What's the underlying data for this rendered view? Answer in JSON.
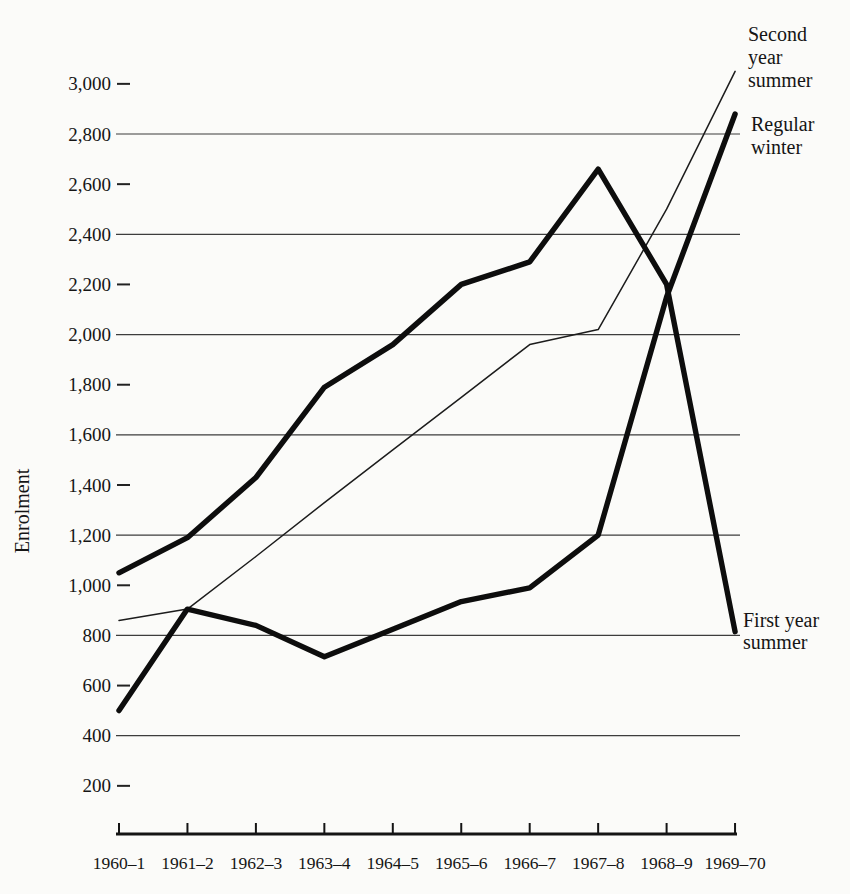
{
  "page": {
    "background_color": "#fbfbf9",
    "ink_color": "#151515"
  },
  "chart_data": {
    "type": "line",
    "title": "",
    "xlabel": "",
    "ylabel": "Enrolment",
    "ylim": [
      0,
      3100
    ],
    "grid": "horizontal solid lines at multiples of 400; short dash ticks at other 200-multiples",
    "legend_position": "right-edge annotations next to line ends",
    "categories": [
      "1960–1",
      "1961–2",
      "1962–3",
      "1963–4",
      "1964–5",
      "1965–6",
      "1966–7",
      "1967–8",
      "1968–9",
      "1969–70"
    ],
    "y_ticks": [
      {
        "value": 3000,
        "label": "3,000",
        "gridline": false
      },
      {
        "value": 2800,
        "label": "2,800",
        "gridline": true
      },
      {
        "value": 2600,
        "label": "2,600",
        "gridline": false
      },
      {
        "value": 2400,
        "label": "2,400",
        "gridline": true
      },
      {
        "value": 2200,
        "label": "2,200",
        "gridline": false
      },
      {
        "value": 2000,
        "label": "2,000",
        "gridline": true
      },
      {
        "value": 1800,
        "label": "1,800",
        "gridline": false
      },
      {
        "value": 1600,
        "label": "1,600",
        "gridline": true
      },
      {
        "value": 1400,
        "label": "1,400",
        "gridline": false
      },
      {
        "value": 1200,
        "label": "1,200",
        "gridline": true
      },
      {
        "value": 1000,
        "label": "1,000",
        "gridline": false
      },
      {
        "value": 800,
        "label": "800",
        "gridline": true
      },
      {
        "value": 600,
        "label": "600",
        "gridline": false
      },
      {
        "value": 400,
        "label": "400",
        "gridline": true
      },
      {
        "value": 200,
        "label": "200",
        "gridline": false
      }
    ],
    "series": [
      {
        "name": "Second year summer",
        "label_lines": [
          "Second",
          "year",
          "summer"
        ],
        "weight": "thin",
        "values": [
          860,
          905,
          1115,
          1330,
          1540,
          1750,
          1960,
          2020,
          2500,
          3050
        ]
      },
      {
        "name": "Regular winter",
        "label_lines": [
          "Regular",
          "winter"
        ],
        "weight": "thick",
        "values": [
          500,
          905,
          840,
          715,
          825,
          935,
          990,
          1200,
          2150,
          2880
        ]
      },
      {
        "name": "First year summer",
        "label_lines": [
          "First year",
          "summer"
        ],
        "weight": "thick",
        "values": [
          1050,
          1190,
          1430,
          1790,
          1960,
          2200,
          2290,
          2660,
          2200,
          815
        ]
      }
    ]
  }
}
